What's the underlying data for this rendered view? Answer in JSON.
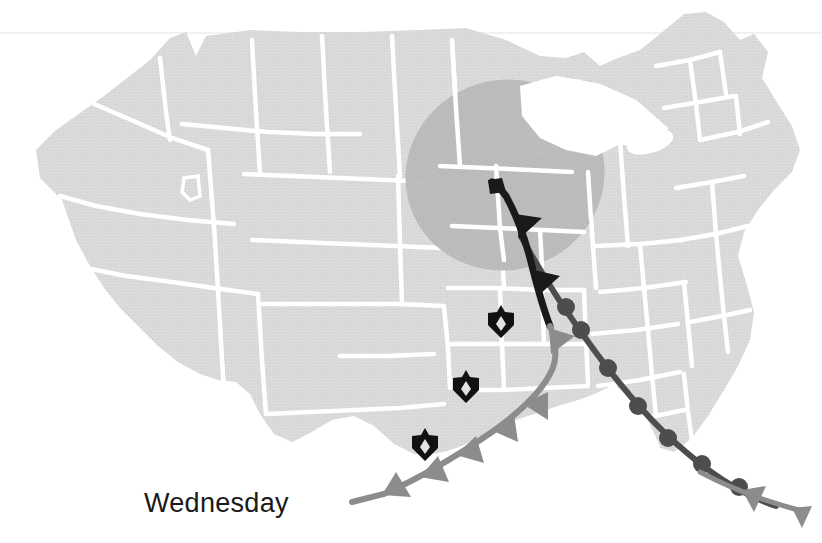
{
  "figure": {
    "kind": "weather-forecast-map",
    "region": "Continental United States",
    "day_label": "Wednesday",
    "background_color": "#ffffff"
  },
  "colors": {
    "land_fill": "#d9d9d9",
    "land_fill_alt": "#dcdcdc",
    "state_border": "#ffffff",
    "precip_shade": "#b9b9b9",
    "cold_front_dark": "#1a1a1a",
    "cold_front_gray": "#8c8c8c",
    "warm_front": "#4d4d4d",
    "storm_marker": "#111111",
    "scan_line": "#ededed",
    "water": "#ffffff"
  },
  "map": {
    "landmass_name": "united-states-landmass",
    "water_bodies": [
      "great-lakes",
      "atlantic-ocean",
      "gulf-of-mexico",
      "pacific-ocean"
    ],
    "scan_line_y": 33
  },
  "precipitation_area": {
    "name": "precipitation-shading",
    "label": "Shaded precipitation region over the upper Midwest",
    "center_x": 505,
    "center_y": 175,
    "radius_x": 100,
    "radius_y": 95,
    "rotation_deg": -18,
    "fill": "#b9b9b9"
  },
  "fronts": [
    {
      "id": "cold-front",
      "type": "cold",
      "symbol": "triangles",
      "symbol_side": "east",
      "segments": [
        {
          "id": "cold-front-upper",
          "color": "#1a1a1a",
          "width": 7
        },
        {
          "id": "cold-front-lower",
          "color": "#8c8c8c",
          "width": 6
        }
      ],
      "barb_count": 9,
      "path_label": "Runs from upper Midwest south-southwest across the Plains into south Texas"
    },
    {
      "id": "warm-front",
      "type": "warm",
      "symbol": "semicircles",
      "symbol_side": "west",
      "color": "#4d4d4d",
      "width": 6,
      "bump_count": 7,
      "path_label": "Arcs from the Great Lakes southeast across the Ohio Valley to the Southeast coast"
    },
    {
      "id": "cold-front-tail",
      "type": "cold",
      "symbol": "triangles",
      "symbol_side": "south",
      "color": "#8c8c8c",
      "width": 5,
      "barb_count": 2,
      "path_label": "Trailing segment extending east off the Atlantic coast"
    }
  ],
  "storm_markers": [
    {
      "id": "storm-marker-1",
      "x": 501,
      "y": 320,
      "label": "severe storm symbol"
    },
    {
      "id": "storm-marker-2",
      "x": 466,
      "y": 385,
      "label": "severe storm symbol"
    },
    {
      "id": "storm-marker-3",
      "x": 425,
      "y": 443,
      "label": "severe storm symbol"
    }
  ],
  "day_label": {
    "text": "Wednesday",
    "x": 144,
    "y": 512,
    "color": "#1a1a1a"
  }
}
